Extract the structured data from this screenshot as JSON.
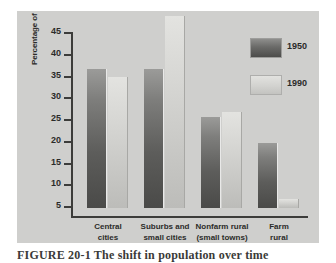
{
  "figure": {
    "caption": "FIGURE 20-1  The shift in population over time"
  },
  "legend": {
    "position": "top-right",
    "entries": [
      {
        "label": "1950",
        "swatch": "dark-gray-gradient-swatch"
      },
      {
        "label": "1990",
        "swatch": "light-gray-gradient-swatch"
      }
    ]
  },
  "axes": {
    "ylabel": "Percentage of U.S. population",
    "yticks": [
      45,
      40,
      35,
      30,
      25,
      20,
      15,
      10,
      5
    ],
    "ylim": [
      0,
      46
    ],
    "xlabel": ""
  },
  "chart_data": {
    "type": "bar",
    "title": "",
    "xlabel": "",
    "ylabel": "Percentage of U.S. population",
    "ylim": [
      0,
      46
    ],
    "yticks": [
      5,
      10,
      15,
      20,
      25,
      30,
      35,
      40,
      45
    ],
    "grid": false,
    "legend_position": "top-right",
    "categories": [
      "Central cities",
      "Suburbs and small cities",
      "Nonfarm rural (small towns)",
      "Farm rural"
    ],
    "category_lines": [
      [
        "Central",
        "cities"
      ],
      [
        "Suburbs and",
        "small cities"
      ],
      [
        "Nonfarm rural",
        "(small towns)"
      ],
      [
        "Farm",
        "rural"
      ]
    ],
    "series": [
      {
        "name": "1950",
        "color": "#5d5d5b",
        "values": [
          32,
          32,
          21,
          15
        ]
      },
      {
        "name": "1990",
        "color": "#d0d0cd",
        "values": [
          30,
          44,
          22,
          2
        ]
      }
    ]
  },
  "colors": {
    "panel_background": "#cfcfcd",
    "page_background": "#ffffff",
    "axis": "#3c3c3a",
    "text": "#2b2b29",
    "series_1950": "#5d5d5b",
    "series_1990": "#d0d0cd"
  }
}
